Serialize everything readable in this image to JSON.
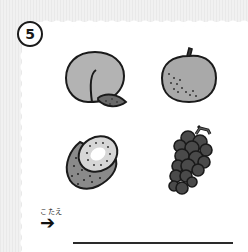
{
  "question": {
    "number": "5"
  },
  "fruits": [
    {
      "name": "peach",
      "icon": "peach-icon"
    },
    {
      "name": "pear",
      "icon": "pear-icon"
    },
    {
      "name": "kiwi",
      "icon": "kiwi-icon"
    },
    {
      "name": "grapes",
      "icon": "grapes-icon"
    }
  ],
  "answer": {
    "label": "こたえ",
    "arrow": "➔",
    "value": ""
  },
  "colors": {
    "outline": "#1a1a1a",
    "peach": "#b3b3b3",
    "pear": "#a9a9a9",
    "kiwi_skin": "#8a8a8a",
    "kiwi_flesh": "#d6d6d6",
    "grapes": "#4a4a4a",
    "paper": "#ffffff",
    "background": "#ededed"
  }
}
